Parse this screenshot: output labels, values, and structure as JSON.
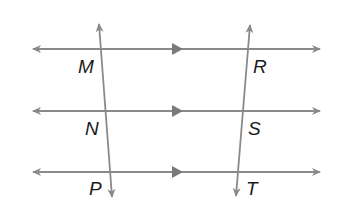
{
  "diagram": {
    "line_color": "#8a8a8a",
    "label_color": "#1a1a1a",
    "parallel_lines": [
      {
        "name": "line-top",
        "y": 49,
        "x1": 33,
        "x2": 320,
        "marker_x": 178
      },
      {
        "name": "line-middle",
        "y": 111,
        "x1": 33,
        "x2": 320,
        "marker_x": 178
      },
      {
        "name": "line-bottom",
        "y": 172,
        "x1": 33,
        "x2": 320,
        "marker_x": 178
      }
    ],
    "transversals": [
      {
        "name": "transversal-left",
        "x1": 99,
        "y1": 24,
        "x2": 112,
        "y2": 197
      },
      {
        "name": "transversal-right",
        "x1": 250,
        "y1": 25,
        "x2": 236,
        "y2": 196
      }
    ],
    "points": [
      {
        "label": "M",
        "x": 78,
        "y": 73
      },
      {
        "label": "N",
        "x": 85,
        "y": 135
      },
      {
        "label": "P",
        "x": 89,
        "y": 195
      },
      {
        "label": "R",
        "x": 253,
        "y": 73
      },
      {
        "label": "S",
        "x": 248,
        "y": 135
      },
      {
        "label": "T",
        "x": 246,
        "y": 195
      }
    ]
  }
}
